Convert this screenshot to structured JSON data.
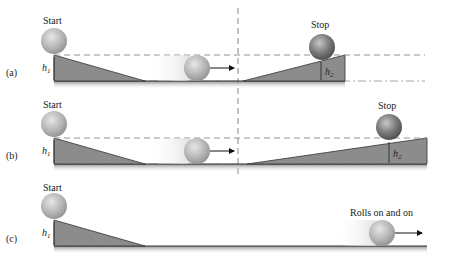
{
  "figure": {
    "panels": [
      {
        "id": "a",
        "label": "(a)",
        "start_label": "Start",
        "end_label": "Stop",
        "h1_label": "h",
        "h1_sub": "1",
        "h2_label": "h",
        "h2_sub": "2"
      },
      {
        "id": "b",
        "label": "(b)",
        "start_label": "Start",
        "end_label": "Stop",
        "h1_label": "h",
        "h1_sub": "1",
        "h2_label": "h",
        "h2_sub": "2"
      },
      {
        "id": "c",
        "label": "(c)",
        "start_label": "Start",
        "end_label": "Rolls on and on",
        "h1_label": "h",
        "h1_sub": "1"
      }
    ],
    "colors": {
      "ramp_fill": "#8c8c8c",
      "ramp_edge": "#333333",
      "floor": "#9a9a9a",
      "dashed": "#888888",
      "ball": "#a8a8a8",
      "ball_dark": "#666666",
      "arrow": "#111111"
    }
  }
}
